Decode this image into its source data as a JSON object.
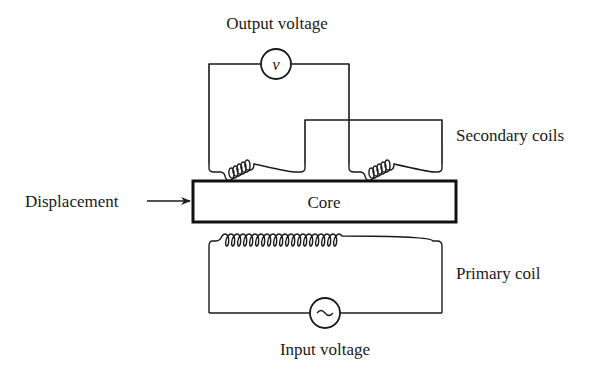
{
  "diagram": {
    "labels": {
      "output_voltage": "Output voltage",
      "secondary_coils": "Secondary coils",
      "displacement": "Displacement",
      "core": "Core",
      "primary_coil": "Primary coil",
      "input_voltage": "Input voltage"
    },
    "symbols": {
      "voltmeter": "v",
      "ac_source": "~"
    },
    "components": [
      {
        "id": "voltmeter",
        "type": "meter",
        "symbol": "v"
      },
      {
        "id": "secondary-coil-left",
        "type": "inductor",
        "turns": 6
      },
      {
        "id": "secondary-coil-right",
        "type": "inductor",
        "turns": 6
      },
      {
        "id": "core",
        "type": "rectangle"
      },
      {
        "id": "primary-coil",
        "type": "inductor",
        "turns": 21
      },
      {
        "id": "ac-source",
        "type": "ac-source",
        "symbol": "~"
      }
    ],
    "colors": {
      "line": "#1a1a1a",
      "background": "#ffffff"
    }
  }
}
